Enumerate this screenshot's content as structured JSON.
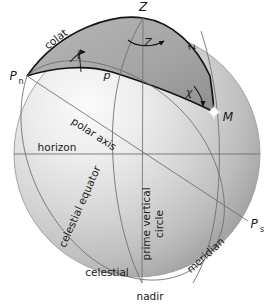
{
  "figure": {
    "background": "#ffffff",
    "sphere": {
      "center_x": 137,
      "center_y": 154,
      "radius": 123,
      "fill_light": "#f2f2f2",
      "fill_mid": "#c9c9c9",
      "fill_dark": "#9a9a9a",
      "outline": "#8e8e8e"
    },
    "triangle_fill": "#a9a9a9",
    "triangle_stroke": "#151515",
    "thin_line": "#6f6f6f"
  },
  "points": [
    {
      "id": "zenith",
      "label": "Z",
      "sub": "",
      "x": 143,
      "y": 11,
      "anchor": "middle"
    },
    {
      "id": "north-pole",
      "label": "P",
      "sub": "n",
      "x": 17,
      "y": 79,
      "anchor": "middle"
    },
    {
      "id": "south-pole",
      "label": "P",
      "sub": "s",
      "x": 258,
      "y": 227,
      "anchor": "middle"
    },
    {
      "id": "star",
      "label": "M",
      "sub": "",
      "x": 222,
      "y": 118,
      "anchor": "middle"
    }
  ],
  "angle_labels": [
    {
      "id": "zenith-angle",
      "label": "Z",
      "x": 148,
      "y": 42,
      "rotate": 0
    },
    {
      "id": "hour-angle",
      "label": "t",
      "x": 78,
      "y": 58,
      "rotate": 0
    },
    {
      "id": "parallactic-angle",
      "label": "χ",
      "x": 188,
      "y": 93,
      "rotate": 0
    }
  ],
  "arc_labels": [
    {
      "id": "colatitude-arc",
      "label": "colat",
      "x": 58,
      "y": 42,
      "rotate": -37
    },
    {
      "id": "polar-distance-arc",
      "label": "p",
      "x": 108,
      "y": 76,
      "rotate": 0
    },
    {
      "id": "zenith-distance-arc",
      "label": "z",
      "x": 188,
      "y": 46,
      "rotate": 72
    }
  ],
  "circle_labels": [
    {
      "id": "polar-axis",
      "label": "polar axis",
      "x": 90,
      "y": 135,
      "rotate": 27
    },
    {
      "id": "horizon",
      "label": "horizon",
      "x": 57,
      "y": 148,
      "rotate": 0
    },
    {
      "id": "celestial-equator-1",
      "label": "celestial",
      "x": 105,
      "y": 273,
      "rotate": 0
    },
    {
      "id": "celestial-equator-2",
      "label": "celestial  equator",
      "x": 82,
      "y": 205,
      "rotate": -66
    },
    {
      "id": "prime-vertical-1",
      "label": "prime vertical",
      "x": 150,
      "y": 222,
      "rotate": -90
    },
    {
      "id": "prime-vertical-2",
      "label": "circle",
      "x": 163,
      "y": 222,
      "rotate": -90
    },
    {
      "id": "meridian",
      "label": "meridian",
      "x": 206,
      "y": 256,
      "rotate": -42
    },
    {
      "id": "nadir",
      "label": "nadir",
      "x": 150,
      "y": 297,
      "rotate": 0
    }
  ]
}
